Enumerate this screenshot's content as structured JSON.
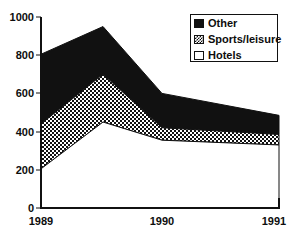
{
  "chart_data": {
    "type": "area",
    "stacked": true,
    "title": "",
    "xlabel": "",
    "ylabel": "",
    "x": [
      "1989",
      "1989 peak",
      "1990",
      "1991"
    ],
    "x_tick_labels": [
      "1989",
      "1990",
      "1991"
    ],
    "y_tick_labels": [
      "0",
      "200",
      "400",
      "600",
      "800",
      "1000"
    ],
    "y_ticks": [
      0,
      200,
      400,
      600,
      800,
      1000
    ],
    "ylim": [
      0,
      1000
    ],
    "grid": false,
    "legend_position": "top-right",
    "series": [
      {
        "name": "Hotels",
        "fill": "white",
        "values": [
          205,
          450,
          355,
          330
        ]
      },
      {
        "name": "Sports/leisure",
        "fill": "checker",
        "values": [
          235,
          250,
          65,
          55
        ]
      },
      {
        "name": "Other",
        "fill": "black",
        "values": [
          365,
          250,
          180,
          100
        ]
      }
    ],
    "cumulative": [
      {
        "name": "Hotels",
        "values": [
          205,
          450,
          355,
          330
        ]
      },
      {
        "name": "Sports/leisure",
        "values": [
          440,
          700,
          420,
          385
        ]
      },
      {
        "name": "Other",
        "values": [
          805,
          950,
          600,
          485
        ]
      }
    ],
    "annotations": []
  },
  "legend": {
    "items": [
      {
        "label": "Other",
        "swatch": "black-square-icon"
      },
      {
        "label": "Sports/leisure",
        "swatch": "checkered-square-icon"
      },
      {
        "label": "Hotels",
        "swatch": "white-square-icon"
      }
    ]
  },
  "axes": {
    "y_labels": [
      "1000",
      "800",
      "600",
      "400",
      "200",
      "0"
    ],
    "x_labels": [
      "1989",
      "1990",
      "1991"
    ]
  },
  "colors": {
    "other": "#111111",
    "sports_leisure_bg": "#ffffff",
    "sports_leisure_fg": "#111111",
    "hotels": "#ffffff",
    "axis": "#111111",
    "text": "#0d0d0d"
  }
}
